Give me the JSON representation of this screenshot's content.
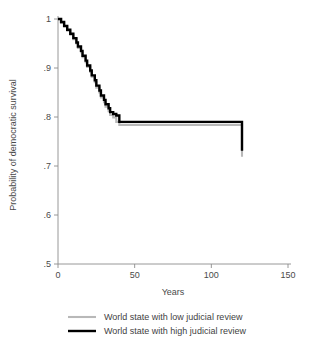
{
  "chart_data": {
    "type": "line",
    "title": "",
    "subtitle": "",
    "xlabel": "Years",
    "ylabel": "Probability of democratic survival",
    "xlim": [
      0,
      150
    ],
    "ylim": [
      0.5,
      1.0
    ],
    "xticks": [
      0,
      50,
      100,
      150
    ],
    "xtick_labels": [
      "0",
      "50",
      "100",
      "150"
    ],
    "yticks": [
      0.5,
      0.6,
      0.7,
      0.8,
      0.9,
      1.0
    ],
    "ytick_labels": [
      ".5",
      ".6",
      ".7",
      ".8",
      ".9",
      "1"
    ],
    "grid": false,
    "legend_position": "below",
    "step_type": "post",
    "series": [
      {
        "name": "World state with low judicial review",
        "color": "#b8b8b8",
        "width": 2.1,
        "x": [
          0,
          2,
          4,
          6,
          8,
          10,
          12,
          13,
          15,
          16,
          18,
          19,
          21,
          22,
          24,
          25,
          27,
          28,
          30,
          31,
          33,
          34,
          36,
          38,
          40,
          67,
          120
        ],
        "y": [
          1.0,
          0.992,
          0.984,
          0.976,
          0.968,
          0.959,
          0.95,
          0.941,
          0.932,
          0.922,
          0.912,
          0.902,
          0.892,
          0.882,
          0.871,
          0.86,
          0.85,
          0.84,
          0.83,
          0.821,
          0.812,
          0.804,
          0.799,
          0.79,
          0.784,
          0.784,
          0.719
        ]
      },
      {
        "name": "World state with high judicial review",
        "color": "#000000",
        "width": 2.4,
        "x": [
          0,
          2,
          4,
          6,
          8,
          10,
          12,
          13,
          15,
          16,
          18,
          19,
          21,
          22,
          24,
          25,
          27,
          28,
          30,
          31,
          33,
          34,
          36,
          38,
          40,
          67,
          120
        ],
        "y": [
          1.0,
          0.994,
          0.986,
          0.978,
          0.97,
          0.961,
          0.952,
          0.944,
          0.935,
          0.925,
          0.915,
          0.905,
          0.895,
          0.885,
          0.875,
          0.864,
          0.854,
          0.844,
          0.835,
          0.826,
          0.818,
          0.81,
          0.806,
          0.803,
          0.79,
          0.79,
          0.731
        ]
      }
    ],
    "legend": [
      {
        "label": "World state with low judicial review",
        "color": "#b8b8b8",
        "width": 2.1
      },
      {
        "label": "World state with high judicial review",
        "color": "#000000",
        "width": 2.4
      }
    ]
  }
}
